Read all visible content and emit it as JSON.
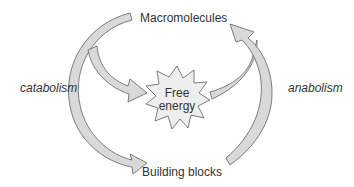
{
  "diagram": {
    "nodes": {
      "top": "Macromolecules",
      "bottom": "Building blocks",
      "center_line1": "Free",
      "center_line2": "energy"
    },
    "processes": {
      "left": "catabolism",
      "right": "anabolism"
    },
    "edges": [
      {
        "from": "Macromolecules",
        "to": "Building blocks",
        "process": "catabolism"
      },
      {
        "from": "Macromolecules",
        "to": "Free energy",
        "process": "catabolism"
      },
      {
        "from": "Building blocks",
        "to": "Macromolecules",
        "process": "anabolism"
      },
      {
        "from": "Free energy",
        "to": "Macromolecules",
        "process": "anabolism"
      }
    ],
    "colors": {
      "arrow_fill": "#d9d9d9",
      "arrow_stroke": "#6e6e6e",
      "text": "#333333",
      "starburst_fill": "#eeeeee"
    }
  }
}
